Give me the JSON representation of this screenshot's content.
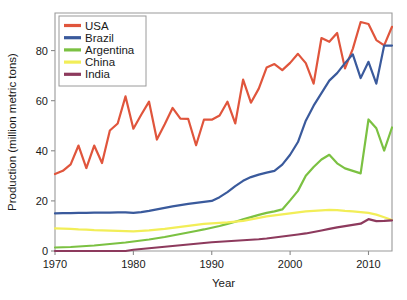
{
  "chart_data": {
    "type": "line",
    "title": "",
    "xlabel": "Year",
    "ylabel": "Production (million metric tons)",
    "xlim": [
      1970,
      2013
    ],
    "ylim": [
      0,
      95
    ],
    "xticks": [
      1970,
      1980,
      1990,
      2000,
      2010
    ],
    "yticks": [
      0,
      20,
      40,
      60,
      80
    ],
    "grid": false,
    "legend_position": "top-left",
    "x": [
      1970,
      1971,
      1972,
      1973,
      1974,
      1975,
      1976,
      1977,
      1978,
      1979,
      1980,
      1981,
      1982,
      1983,
      1984,
      1985,
      1986,
      1987,
      1988,
      1989,
      1990,
      1991,
      1992,
      1993,
      1994,
      1995,
      1996,
      1997,
      1998,
      1999,
      2000,
      2001,
      2002,
      2003,
      2004,
      2005,
      2006,
      2007,
      2008,
      2009,
      2010,
      2011,
      2012,
      2013
    ],
    "series": [
      {
        "name": "USA",
        "color": "#e0553c",
        "values": [
          30.7,
          32.0,
          34.6,
          42.1,
          33.1,
          42.1,
          35.1,
          48.1,
          50.9,
          61.7,
          48.8,
          54.4,
          59.6,
          44.5,
          50.6,
          57.1,
          52.8,
          52.7,
          42.2,
          52.4,
          52.4,
          54.1,
          59.6,
          50.9,
          68.4,
          59.2,
          64.8,
          73.2,
          74.6,
          72.2,
          75.1,
          78.7,
          75.0,
          66.8,
          85.0,
          83.5,
          87.0,
          72.9,
          80.7,
          91.4,
          90.6,
          84.2,
          82.1,
          89.5
        ]
      },
      {
        "name": "Brazil",
        "color": "#3a5a9c",
        "values": [
          15.0,
          15.1,
          15.1,
          15.2,
          15.2,
          15.3,
          15.3,
          15.3,
          15.4,
          15.4,
          15.2,
          15.5,
          16.0,
          16.6,
          17.2,
          17.8,
          18.3,
          18.8,
          19.2,
          19.6,
          20.0,
          21.5,
          23.5,
          25.9,
          28.0,
          29.5,
          30.5,
          31.3,
          32.0,
          34.5,
          38.4,
          43.5,
          52.0,
          58.0,
          63.0,
          68.0,
          71.0,
          75.0,
          78.5,
          69.0,
          75.5,
          66.8,
          82.0,
          82.0
        ]
      },
      {
        "name": "Argentina",
        "color": "#7bc142",
        "values": [
          1.4,
          1.5,
          1.6,
          1.8,
          2.0,
          2.2,
          2.5,
          2.8,
          3.1,
          3.4,
          3.8,
          4.2,
          4.6,
          5.1,
          5.6,
          6.2,
          6.8,
          7.4,
          8.0,
          8.6,
          9.3,
          10.0,
          10.8,
          11.7,
          12.6,
          13.5,
          14.4,
          15.2,
          15.8,
          16.6,
          20.2,
          24.0,
          30.0,
          33.5,
          36.5,
          38.4,
          35.0,
          33.0,
          32.0,
          31.0,
          52.5,
          49.0,
          40.1,
          49.3
        ]
      },
      {
        "name": "China",
        "color": "#f2ee58",
        "values": [
          9.0,
          8.9,
          8.8,
          8.6,
          8.5,
          8.3,
          8.2,
          8.1,
          8.0,
          7.9,
          7.8,
          8.0,
          8.2,
          8.5,
          8.8,
          9.2,
          9.6,
          10.0,
          10.4,
          10.8,
          11.0,
          11.2,
          11.4,
          11.7,
          12.0,
          12.6,
          13.2,
          13.8,
          14.2,
          14.6,
          15.0,
          15.4,
          15.8,
          16.0,
          16.2,
          16.4,
          16.3,
          16.0,
          15.8,
          15.5,
          15.2,
          14.5,
          13.5,
          12.4
        ]
      },
      {
        "name": "India",
        "color": "#8d3a5d",
        "values": [
          0.0,
          0.0,
          0.0,
          0.0,
          0.0,
          0.0,
          0.0,
          0.0,
          0.0,
          0.0,
          0.5,
          0.8,
          1.1,
          1.4,
          1.7,
          2.0,
          2.3,
          2.6,
          2.9,
          3.2,
          3.5,
          3.7,
          3.9,
          4.1,
          4.3,
          4.5,
          4.7,
          5.0,
          5.4,
          5.8,
          6.2,
          6.6,
          7.0,
          7.6,
          8.2,
          8.8,
          9.4,
          9.9,
          10.4,
          10.9,
          12.7,
          11.9,
          12.0,
          12.2
        ]
      }
    ]
  },
  "legend": {
    "items": [
      {
        "label": "USA"
      },
      {
        "label": "Brazil"
      },
      {
        "label": "Argentina"
      },
      {
        "label": "China"
      },
      {
        "label": "India"
      }
    ]
  }
}
